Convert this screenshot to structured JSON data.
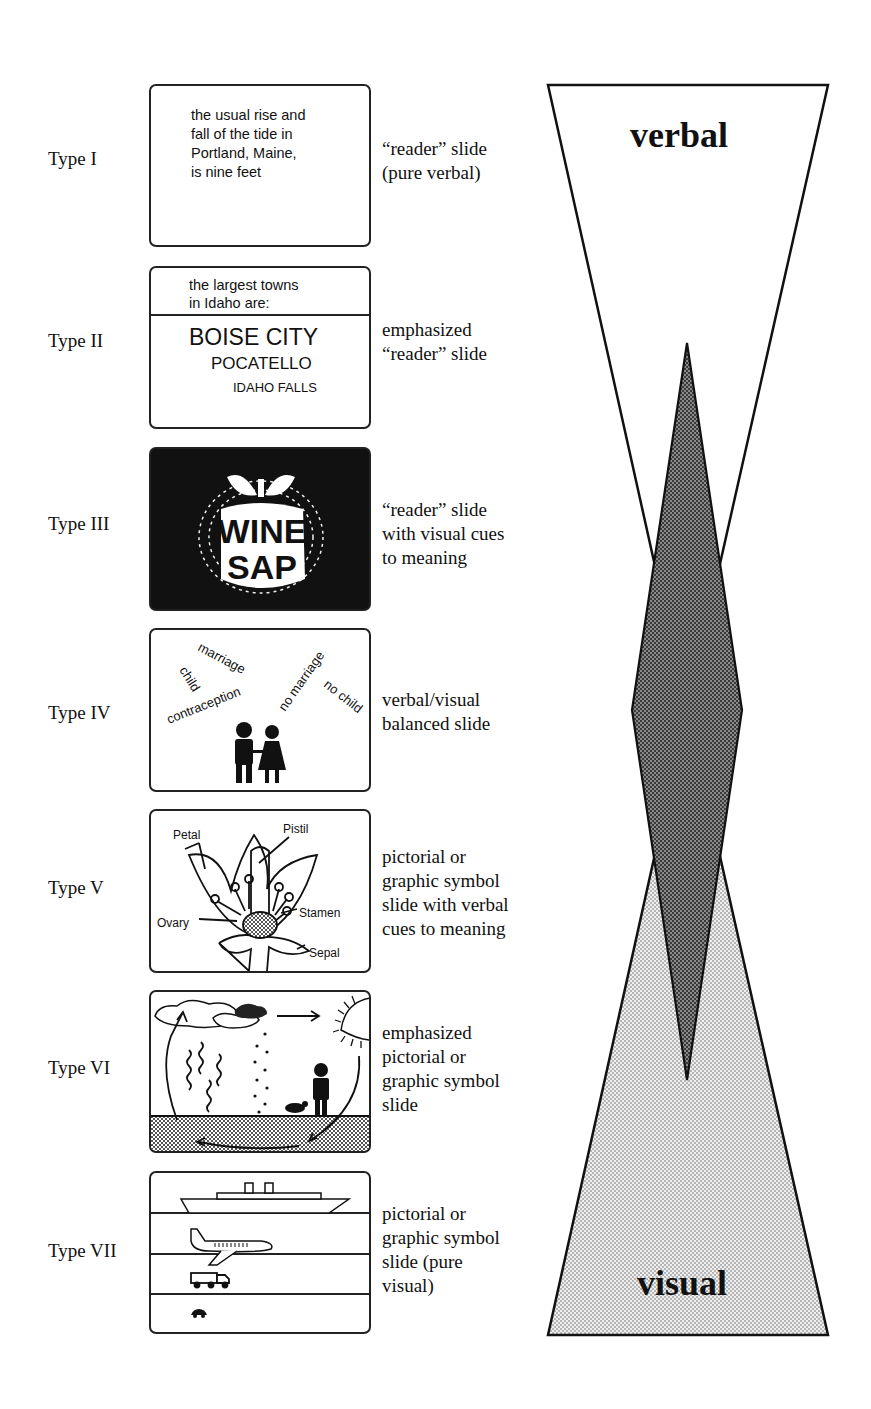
{
  "rows": [
    {
      "type": "Type I",
      "description": [
        "“reader” slide",
        "(pure verbal)"
      ],
      "slide": {
        "lines": [
          "the usual rise and",
          "fall of the tide in",
          "Portland, Maine,",
          "is nine feet"
        ]
      }
    },
    {
      "type": "Type II",
      "description": [
        "emphasized",
        "“reader” slide"
      ],
      "slide": {
        "header": [
          "the largest towns",
          "in Idaho are:"
        ],
        "towns": [
          "BOISE CITY",
          "POCATELLO",
          "IDAHO FALLS"
        ]
      }
    },
    {
      "type": "Type III",
      "description": [
        "“reader” slide",
        "with visual cues",
        "to meaning"
      ],
      "slide": {
        "words": [
          "WINE",
          "SAP"
        ],
        "icon": "apple-icon"
      }
    },
    {
      "type": "Type IV",
      "description": [
        "verbal/visual",
        "balanced slide"
      ],
      "slide": {
        "words": [
          "marriage",
          "child",
          "contraception",
          "no marriage",
          "no child"
        ],
        "icon": "couple-icon"
      }
    },
    {
      "type": "Type V",
      "description": [
        "pictorial or",
        "graphic symbol",
        "slide with verbal",
        "cues to meaning"
      ],
      "slide": {
        "labels": [
          "Petal",
          "Pistil",
          "Stamen",
          "Ovary",
          "Sepal"
        ],
        "icon": "flower-icon"
      }
    },
    {
      "type": "Type VI",
      "description": [
        "emphasized",
        "pictorial or",
        "graphic symbol",
        "slide"
      ],
      "slide": {
        "icon": "water-cycle-icon"
      }
    },
    {
      "type": "Type VII",
      "description": [
        "pictorial or",
        "graphic symbol",
        "slide (pure",
        "visual)"
      ],
      "slide": {
        "icons": [
          "ship-icon",
          "airplane-icon",
          "truck-icon",
          "car-icon"
        ]
      }
    }
  ],
  "scale": {
    "top_label": "verbal",
    "bottom_label": "visual"
  },
  "colors": {
    "ink": "#111111",
    "light_fill": "#d8d8d8",
    "dark_fill": "#555555"
  }
}
